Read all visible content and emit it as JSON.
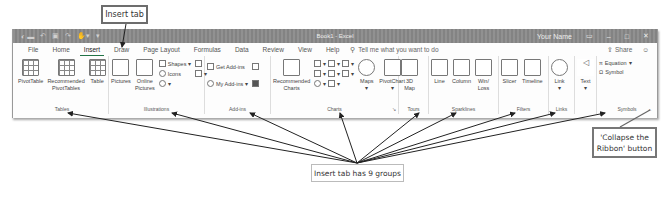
{
  "annotations": {
    "insert_tab_callout": "Insert tab",
    "groups_callout": "Insert tab has 9 groups",
    "collapse_callout_line1": "'Collapse the",
    "collapse_callout_line2": "Ribbon' button"
  },
  "titlebar": {
    "doc_title": "Book1 - Excel",
    "user_name": "Your Name",
    "qat_icons": [
      "autosave-toggle",
      "save-icon",
      "undo-icon",
      "redo-icon",
      "touch-mode-icon",
      "customize-qat-icon"
    ],
    "window_buttons": [
      "ribbon-display-options-icon",
      "minimize-icon",
      "maximize-icon",
      "close-icon"
    ]
  },
  "tabs": {
    "items": [
      {
        "label": "File"
      },
      {
        "label": "Home"
      },
      {
        "label": "Insert",
        "active": true
      },
      {
        "label": "Draw"
      },
      {
        "label": "Page Layout"
      },
      {
        "label": "Formulas"
      },
      {
        "label": "Data"
      },
      {
        "label": "Review"
      },
      {
        "label": "View"
      },
      {
        "label": "Help"
      }
    ],
    "search_placeholder": "Tell me what you want to do",
    "share_label": "Share",
    "feedback_icon": "smiley-icon"
  },
  "ribbon": {
    "groups": [
      {
        "label": "Tables",
        "buttons": [
          "PivotTable",
          "Recommended PivotTables",
          "Table"
        ]
      },
      {
        "label": "Illustrations",
        "buttons": [
          "Pictures",
          "Online Pictures",
          "Shapes",
          "Icons",
          "3D Models",
          "SmartArt",
          "Screenshot"
        ]
      },
      {
        "label": "Add-ins",
        "buttons": [
          "Get Add-ins",
          "My Add-ins",
          "Bing Maps",
          "People Graph"
        ]
      },
      {
        "label": "Charts",
        "buttons": [
          "Recommended Charts",
          "Column Chart",
          "Hierarchy Chart",
          "Line Chart",
          "Statistic Chart",
          "Pie Chart",
          "Scatter Chart",
          "Combo Chart",
          "Waterfall Chart",
          "Maps",
          "PivotChart"
        ]
      },
      {
        "label": "Tours",
        "buttons": [
          "3D Map"
        ]
      },
      {
        "label": "Sparklines",
        "buttons": [
          "Line",
          "Column",
          "Win/Loss"
        ]
      },
      {
        "label": "Filters",
        "buttons": [
          "Slicer",
          "Timeline"
        ]
      },
      {
        "label": "Links",
        "buttons": [
          "Link"
        ]
      },
      {
        "label": "Text",
        "buttons": [
          "Text"
        ]
      },
      {
        "label": "Symbols",
        "buttons": [
          "Equation",
          "Symbol"
        ]
      }
    ],
    "labels": {
      "pivottable": "PivotTable",
      "recommended_pivottables_1": "Recommended",
      "recommended_pivottables_2": "PivotTables",
      "table": "Table",
      "pictures": "Pictures",
      "online_pictures_1": "Online",
      "online_pictures_2": "Pictures",
      "shapes": "Shapes",
      "icons": "Icons",
      "get_addins": "Get Add-ins",
      "my_addins": "My Add-ins",
      "recommended_charts_1": "Recommended",
      "recommended_charts_2": "Charts",
      "maps": "Maps",
      "pivotchart": "PivotChart",
      "map3d_1": "3D",
      "map3d_2": "Map",
      "line": "Line",
      "column": "Column",
      "winloss_1": "Win/",
      "winloss_2": "Loss",
      "slicer": "Slicer",
      "timeline": "Timeline",
      "link": "Link",
      "text": "Text",
      "equation": "Equation",
      "symbol": "Symbol",
      "tables_group": "Tables",
      "illustrations_group": "Illustrations",
      "addins_group": "Add-ins",
      "charts_group": "Charts",
      "tours_group": "Tours",
      "sparklines_group": "Sparklines",
      "filters_group": "Filters",
      "links_group": "Links",
      "symbols_group": "Symbols"
    },
    "collapse_button_glyph": "^"
  }
}
